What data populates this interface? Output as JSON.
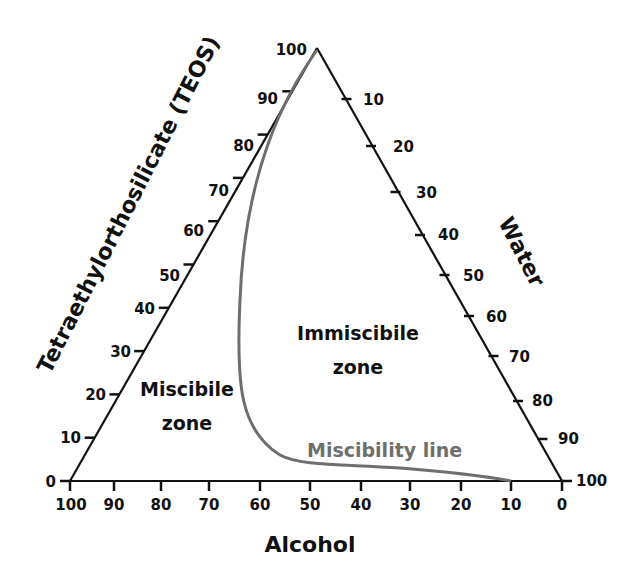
{
  "diagram": {
    "type": "ternary",
    "axes": {
      "left": {
        "title": "Tetraethylorthosilicate (TEOS)",
        "ticks": [
          "0",
          "10",
          "20",
          "30",
          "40",
          "50",
          "60",
          "70",
          "80",
          "90",
          "100"
        ]
      },
      "right": {
        "title": "Water",
        "ticks": [
          "10",
          "20",
          "30",
          "40",
          "50",
          "60",
          "70",
          "80",
          "90",
          "100"
        ]
      },
      "bottom": {
        "title": "Alcohol",
        "ticks": [
          "100",
          "90",
          "80",
          "70",
          "60",
          "50",
          "40",
          "30",
          "20",
          "10",
          "0"
        ]
      }
    },
    "zones": {
      "miscible_line1": "Miscibile",
      "miscible_line2": "zone",
      "immiscible_line1": "Immiscibile",
      "immiscible_line2": "zone"
    },
    "curve": {
      "label": "Miscibility line",
      "color": "#6e6e6e"
    },
    "colors": {
      "axis": "#111111",
      "curve": "#6e6e6e"
    }
  }
}
